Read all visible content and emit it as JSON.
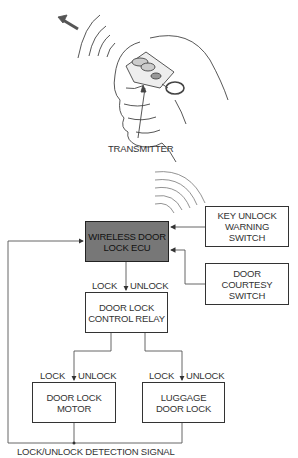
{
  "illustration": {
    "label": "TRANSMITTER"
  },
  "blocks": {
    "ecu": [
      "WIRELESS DOOR",
      "LOCK ECU"
    ],
    "key_unlock": [
      "KEY UNLOCK",
      "WARNING",
      "SWITCH"
    ],
    "courtesy": [
      "DOOR",
      "COURTESY",
      "SWITCH"
    ],
    "relay": [
      "DOOR LOCK",
      "CONTROL RELAY"
    ],
    "motor": [
      "DOOR LOCK",
      "MOTOR"
    ],
    "luggage": [
      "LUGGAGE",
      "DOOR LOCK"
    ]
  },
  "signals": {
    "ecu_lock": "LOCK",
    "ecu_unlock": "UNLOCK",
    "motor_lock": "LOCK",
    "motor_unlock": "UNLOCK",
    "luggage_lock": "LOCK",
    "luggage_unlock": "UNLOCK",
    "detection": "LOCK/UNLOCK DETECTION SIGNAL"
  },
  "colors": {
    "ecu_fill": "#777777",
    "line": "#555555"
  }
}
